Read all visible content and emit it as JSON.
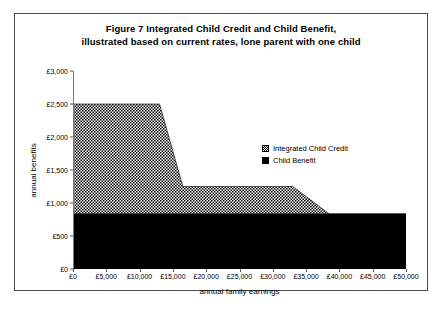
{
  "figure": {
    "title_line1": "Figure 7   Integrated Child Credit and Child Benefit,",
    "title_line2": "illustrated based on current rates, lone parent with one child"
  },
  "chart_data": {
    "type": "area",
    "stacked": true,
    "title": "Figure 7   Integrated Child Credit and Child Benefit, illustrated based on current rates, lone parent with one child",
    "xlabel": "annual family earnings",
    "ylabel": "annual benefits",
    "xlim": [
      0,
      50000
    ],
    "ylim": [
      0,
      3000
    ],
    "xticks": [
      0,
      5000,
      10000,
      15000,
      20000,
      25000,
      30000,
      35000,
      40000,
      45000,
      50000
    ],
    "xticklabels": [
      "£0",
      "£5,000",
      "£10,000",
      "£15,000",
      "£20,000",
      "£25,000",
      "£30,000",
      "£35,000",
      "£40,000",
      "£45,000",
      "£50,000"
    ],
    "yticks": [
      0,
      500,
      1000,
      1500,
      2000,
      2500,
      3000
    ],
    "yticklabels": [
      "£0",
      "£500",
      "£1,000",
      "£1,500",
      "£2,000",
      "£2,500",
      "£3,000"
    ],
    "grid": false,
    "legend_position": "inside-right",
    "x": [
      0,
      13000,
      16500,
      33000,
      38500,
      50000
    ],
    "series": [
      {
        "name": "Integrated Child Credit",
        "fill": "hatch",
        "color": "#000000",
        "values": [
          1667,
          1667,
          417,
          417,
          0,
          0
        ]
      },
      {
        "name": "Child Benefit",
        "fill": "solid",
        "color": "#000000",
        "values": [
          833,
          833,
          833,
          833,
          833,
          833
        ]
      }
    ],
    "stack_totals": [
      2500,
      2500,
      1250,
      1250,
      833,
      833
    ]
  }
}
